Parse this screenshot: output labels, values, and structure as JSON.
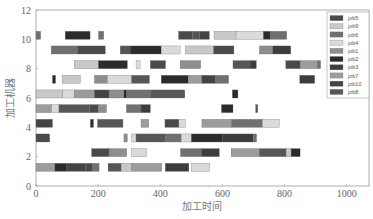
{
  "chart_data": {
    "type": "gantt",
    "title": "",
    "xlabel": "加工时间",
    "ylabel": "加工机器",
    "xlim": [
      0,
      1080
    ],
    "ylim": [
      0,
      12
    ],
    "xticks": [
      0,
      200,
      400,
      600,
      800,
      1000
    ],
    "yticks": [
      0,
      2,
      4,
      6,
      8,
      10,
      12
    ],
    "grid": false,
    "legend_position": "upper right",
    "legend": [
      {
        "name": "job5",
        "color": "#4a4a4a"
      },
      {
        "name": "job9",
        "color": "#c8c8c8"
      },
      {
        "name": "job6",
        "color": "#707070"
      },
      {
        "name": "job4",
        "color": "#dadada"
      },
      {
        "name": "job1",
        "color": "#8e8e8e"
      },
      {
        "name": "job2",
        "color": "#2b2b2b"
      },
      {
        "name": "job3",
        "color": "#3d3d3d"
      },
      {
        "name": "job7",
        "color": "#9c9c9c"
      },
      {
        "name": "job10",
        "color": "#444444"
      },
      {
        "name": "job8",
        "color": "#565656"
      }
    ],
    "machines": [
      {
        "machine": 10,
        "tasks": [
          {
            "job": "job6",
            "start": 0,
            "end": 15
          },
          {
            "job": "job2",
            "start": 94,
            "end": 174
          },
          {
            "job": "job6",
            "start": 201,
            "end": 218
          },
          {
            "job": "job5",
            "start": 459,
            "end": 504
          },
          {
            "job": "job8",
            "start": 504,
            "end": 526
          },
          {
            "job": "job10",
            "start": 526,
            "end": 558
          },
          {
            "job": "job9",
            "start": 573,
            "end": 644
          },
          {
            "job": "job4",
            "start": 644,
            "end": 732
          },
          {
            "job": "job2",
            "start": 732,
            "end": 755
          },
          {
            "job": "job6",
            "start": 755,
            "end": 807
          }
        ]
      },
      {
        "machine": 9,
        "tasks": [
          {
            "job": "job6",
            "start": 49,
            "end": 133
          },
          {
            "job": "job5",
            "start": 133,
            "end": 223
          },
          {
            "job": "job8",
            "start": 271,
            "end": 303
          },
          {
            "job": "job2",
            "start": 303,
            "end": 403
          },
          {
            "job": "job4",
            "start": 403,
            "end": 464
          },
          {
            "job": "job9",
            "start": 480,
            "end": 572
          },
          {
            "job": "job5",
            "start": 572,
            "end": 637
          },
          {
            "job": "job1",
            "start": 719,
            "end": 762
          },
          {
            "job": "job3",
            "start": 762,
            "end": 820
          }
        ]
      },
      {
        "machine": 8,
        "tasks": [
          {
            "job": "job9",
            "start": 123,
            "end": 201
          },
          {
            "job": "job2",
            "start": 201,
            "end": 294
          },
          {
            "job": "job4",
            "start": 322,
            "end": 335
          },
          {
            "job": "job5",
            "start": 368,
            "end": 417
          },
          {
            "job": "job1",
            "start": 464,
            "end": 530
          },
          {
            "job": "job8",
            "start": 634,
            "end": 689
          },
          {
            "job": "job3",
            "start": 689,
            "end": 709
          },
          {
            "job": "job5",
            "start": 804,
            "end": 850
          },
          {
            "job": "job7",
            "start": 850,
            "end": 906
          },
          {
            "job": "job6",
            "start": 906,
            "end": 916
          }
        ]
      },
      {
        "machine": 7,
        "tasks": [
          {
            "job": "job2",
            "start": 53,
            "end": 63
          },
          {
            "job": "job9",
            "start": 84,
            "end": 143
          },
          {
            "job": "job1",
            "start": 188,
            "end": 230
          },
          {
            "job": "job4",
            "start": 230,
            "end": 308
          },
          {
            "job": "job8",
            "start": 308,
            "end": 365
          },
          {
            "job": "job2",
            "start": 403,
            "end": 490
          },
          {
            "job": "job7",
            "start": 490,
            "end": 534
          },
          {
            "job": "job10",
            "start": 534,
            "end": 577
          },
          {
            "job": "job6",
            "start": 577,
            "end": 620
          },
          {
            "job": "job3",
            "start": 849,
            "end": 897
          }
        ]
      },
      {
        "machine": 6,
        "tasks": [
          {
            "job": "job9",
            "start": 0,
            "end": 86
          },
          {
            "job": "job4",
            "start": 86,
            "end": 123
          },
          {
            "job": "job7",
            "start": 123,
            "end": 188
          },
          {
            "job": "job10",
            "start": 188,
            "end": 235
          },
          {
            "job": "job1",
            "start": 235,
            "end": 283
          },
          {
            "job": "job2",
            "start": 283,
            "end": 292
          },
          {
            "job": "job6",
            "start": 292,
            "end": 368
          },
          {
            "job": "job8",
            "start": 368,
            "end": 479
          },
          {
            "job": "job2",
            "start": 632,
            "end": 650
          }
        ]
      },
      {
        "machine": 5,
        "tasks": [
          {
            "job": "job7",
            "start": 0,
            "end": 50
          },
          {
            "job": "job4",
            "start": 50,
            "end": 74
          },
          {
            "job": "job8",
            "start": 74,
            "end": 172
          },
          {
            "job": "job5",
            "start": 172,
            "end": 201
          },
          {
            "job": "job1",
            "start": 201,
            "end": 227
          },
          {
            "job": "job6",
            "start": 291,
            "end": 338
          },
          {
            "job": "job3",
            "start": 338,
            "end": 368
          },
          {
            "job": "job2",
            "start": 597,
            "end": 634
          },
          {
            "job": "job8",
            "start": 707,
            "end": 714
          }
        ]
      },
      {
        "machine": 4,
        "tasks": [
          {
            "job": "job10",
            "start": 0,
            "end": 53
          },
          {
            "job": "job2",
            "start": 175,
            "end": 185
          },
          {
            "job": "job8",
            "start": 198,
            "end": 280
          },
          {
            "job": "job7",
            "start": 338,
            "end": 363
          },
          {
            "job": "job5",
            "start": 415,
            "end": 460
          },
          {
            "job": "job4",
            "start": 460,
            "end": 481
          },
          {
            "job": "job7",
            "start": 534,
            "end": 629
          },
          {
            "job": "job6",
            "start": 629,
            "end": 729
          },
          {
            "job": "job4",
            "start": 729,
            "end": 783
          }
        ]
      },
      {
        "machine": 3,
        "tasks": [
          {
            "job": "job5",
            "start": 0,
            "end": 44
          },
          {
            "job": "job1",
            "start": 283,
            "end": 294
          },
          {
            "job": "job4",
            "start": 307,
            "end": 322
          },
          {
            "job": "job8",
            "start": 322,
            "end": 417
          },
          {
            "job": "job6",
            "start": 417,
            "end": 467
          },
          {
            "job": "job4",
            "start": 467,
            "end": 500
          },
          {
            "job": "job2",
            "start": 500,
            "end": 599
          },
          {
            "job": "job3",
            "start": 599,
            "end": 700
          },
          {
            "job": "job6",
            "start": 700,
            "end": 710
          }
        ]
      },
      {
        "machine": 2,
        "tasks": [
          {
            "job": "job5",
            "start": 179,
            "end": 235
          },
          {
            "job": "job1",
            "start": 235,
            "end": 292
          },
          {
            "job": "job4",
            "start": 307,
            "end": 356
          },
          {
            "job": "job6",
            "start": 465,
            "end": 532
          },
          {
            "job": "job3",
            "start": 532,
            "end": 590
          },
          {
            "job": "job7",
            "start": 628,
            "end": 719
          },
          {
            "job": "job8",
            "start": 719,
            "end": 805
          },
          {
            "job": "job9",
            "start": 805,
            "end": 821
          },
          {
            "job": "job2",
            "start": 821,
            "end": 850
          }
        ]
      },
      {
        "machine": 1,
        "tasks": [
          {
            "job": "job7",
            "start": 0,
            "end": 61
          },
          {
            "job": "job2",
            "start": 61,
            "end": 97
          },
          {
            "job": "job10",
            "start": 97,
            "end": 159
          },
          {
            "job": "job5",
            "start": 159,
            "end": 181
          },
          {
            "job": "job6",
            "start": 181,
            "end": 203
          },
          {
            "job": "job8",
            "start": 232,
            "end": 274
          },
          {
            "job": "job9",
            "start": 274,
            "end": 307
          },
          {
            "job": "job7",
            "start": 307,
            "end": 405
          },
          {
            "job": "job3",
            "start": 416,
            "end": 492
          },
          {
            "job": "job4",
            "start": 500,
            "end": 559
          }
        ]
      }
    ]
  }
}
